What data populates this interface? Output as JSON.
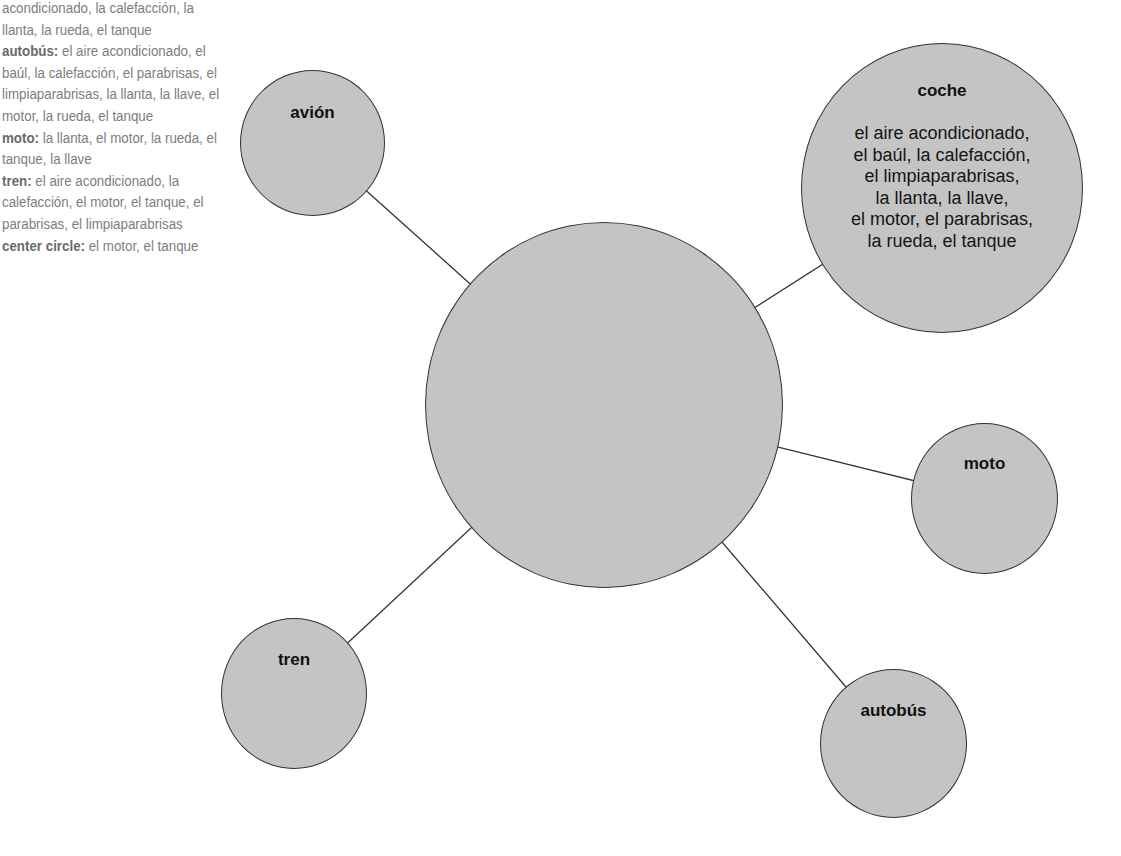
{
  "answer_key": {
    "lines": [
      {
        "label": "",
        "text": "acondicionado, la calefacción, la llanta, la rueda, el tanque"
      },
      {
        "label": "autobús:",
        "text": " el aire acondicionado, el baúl, la calefacción, el parabrisas, el limpiaparabrisas, la llanta, la llave, el motor, la rueda, el tanque"
      },
      {
        "label": "moto:",
        "text": " la llanta, el motor, la rueda, el tanque, la llave"
      },
      {
        "label": "tren:",
        "text": " el aire acondicionado, la calefacción, el motor, el tanque, el parabrisas, el limpiaparabrisas"
      },
      {
        "label": "center circle:",
        "text": " el motor, el tanque"
      }
    ]
  },
  "diagram": {
    "center": {
      "label": ""
    },
    "nodes": {
      "avion": {
        "title": "avión"
      },
      "coche": {
        "title": "coche",
        "body": "el aire acondicionado,\nel baúl, la calefacción,\nel limpiaparabrisas,\nla llanta, la llave,\nel motor, el parabrisas,\nla rueda, el tanque"
      },
      "moto": {
        "title": "moto"
      },
      "tren": {
        "title": "tren"
      },
      "autobus": {
        "title": "autobús"
      }
    },
    "colors": {
      "fill": "#c4c4c4",
      "stroke": "#333333",
      "key_text": "#7d7d7d"
    }
  }
}
